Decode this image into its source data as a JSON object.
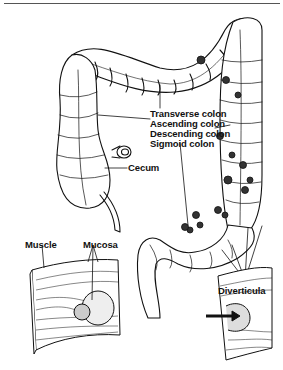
{
  "figure": {
    "labels": {
      "transverse_colon": "Transverse colon",
      "ascending_colon": "Ascending colon",
      "descending_colon": "Descending colon",
      "sigmoid_colon": "Sigmoid colon",
      "cecum": "Cecum",
      "muscle": "Muscle",
      "mucosa": "Mucosa",
      "diverticula": "Diverticula"
    }
  },
  "colors": {
    "ink": "#111111",
    "background": "#ffffff",
    "rule": "#555555"
  }
}
